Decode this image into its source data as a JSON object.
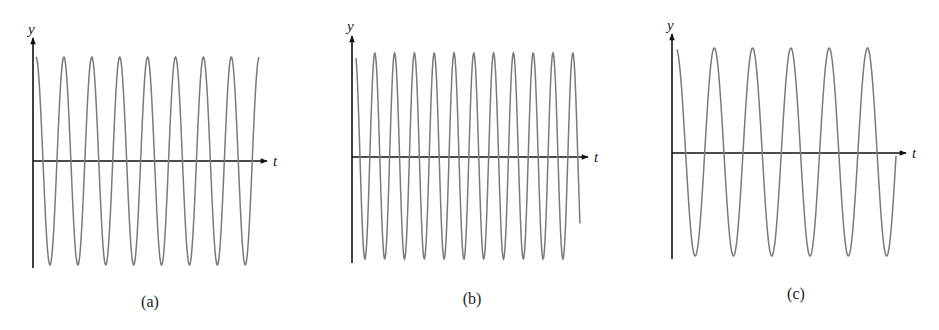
{
  "chart_data": [
    {
      "type": "line",
      "panel": "a",
      "caption": "(a)",
      "xlabel": "t",
      "ylabel": "y",
      "description": "Sinusoid (cosine-like) starting near maximum, 8.5 cycles over visible range",
      "function": "y = cos(omega*t)",
      "cycles_shown": 8.2,
      "amplitude": 1,
      "grid": false,
      "geom": {
        "yaxis_x": 33,
        "yaxis_top": 38,
        "yaxis_bottom": 268,
        "taxis_y": 161,
        "taxis_left": 33,
        "taxis_right": 267,
        "peak_y": 57,
        "trough_y": 265,
        "curve_start_x": 36,
        "curve_end_x": 259,
        "period_px": 27.9,
        "phase_first_peak_x": 36,
        "ylabel_x": 28,
        "ylabel_y": 34,
        "tlabel_x": 273,
        "tlabel_y": 166
      }
    },
    {
      "type": "line",
      "panel": "b",
      "caption": "(b)",
      "xlabel": "t",
      "ylabel": "y",
      "description": "Sinusoid with higher frequency, about 11.5 cycles over visible range",
      "function": "y = cos(omega*t)",
      "cycles_shown": 11.3,
      "amplitude": 1,
      "grid": false,
      "geom": {
        "yaxis_x": 352,
        "yaxis_top": 36,
        "yaxis_bottom": 263,
        "taxis_y": 157,
        "taxis_left": 352,
        "taxis_right": 588,
        "peak_y": 53,
        "trough_y": 259,
        "curve_start_x": 356,
        "curve_end_x": 580,
        "period_px": 19.8,
        "phase_first_peak_x": 355,
        "ylabel_x": 347,
        "ylabel_y": 31,
        "tlabel_x": 594,
        "tlabel_y": 162
      }
    },
    {
      "type": "line",
      "panel": "c",
      "caption": "(c)",
      "xlabel": "t",
      "ylabel": "y",
      "description": "Sinusoid with lower frequency, about 5.7 cycles over visible range",
      "function": "y = cos(omega*t)",
      "cycles_shown": 5.7,
      "amplitude": 1,
      "grid": false,
      "geom": {
        "yaxis_x": 672,
        "yaxis_top": 34,
        "yaxis_bottom": 259,
        "taxis_y": 153,
        "taxis_left": 672,
        "taxis_right": 906,
        "peak_y": 48,
        "trough_y": 256,
        "curve_start_x": 677,
        "curve_end_x": 896,
        "period_px": 38.3,
        "phase_first_peak_x": 676,
        "ylabel_x": 667,
        "ylabel_y": 30,
        "tlabel_x": 912,
        "tlabel_y": 158
      }
    }
  ],
  "captions": {
    "a": "(a)",
    "b": "(b)",
    "c": "(c)"
  },
  "axis_labels": {
    "y": "y",
    "t": "t"
  },
  "colors": {
    "axis": "#111111",
    "curve": "#7a7a7a",
    "text": "#222222",
    "background": "#ffffff"
  }
}
